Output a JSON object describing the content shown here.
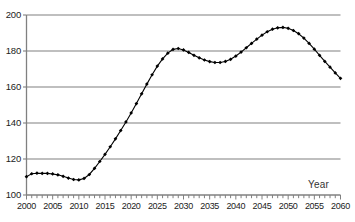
{
  "chart_data": {
    "type": "line",
    "title": "",
    "xlabel": "Year",
    "ylabel": "",
    "xlim": [
      2000,
      2060
    ],
    "ylim": [
      100,
      200
    ],
    "grid": true,
    "legend": null,
    "markers": "filled-diamond",
    "line_color": "#000000",
    "grid_color": "#808080",
    "axis_color": "#808080",
    "x_tick_labels": [
      "2000",
      "2005",
      "2010",
      "2015",
      "2020",
      "2025",
      "2030",
      "2035",
      "2040",
      "2045",
      "2050",
      "2055",
      "2060"
    ],
    "x_tick_step_major": 5,
    "x_tick_step_minor": 1,
    "y_tick_labels": [
      "100",
      "120",
      "140",
      "160",
      "180",
      "200"
    ],
    "y_tick_step": 20,
    "x": [
      2000,
      2001,
      2002,
      2003,
      2004,
      2005,
      2006,
      2007,
      2008,
      2009,
      2010,
      2011,
      2012,
      2013,
      2014,
      2015,
      2016,
      2017,
      2018,
      2019,
      2020,
      2021,
      2022,
      2023,
      2024,
      2025,
      2026,
      2027,
      2028,
      2029,
      2030,
      2031,
      2032,
      2033,
      2034,
      2035,
      2036,
      2037,
      2038,
      2039,
      2040,
      2041,
      2042,
      2043,
      2044,
      2045,
      2046,
      2047,
      2048,
      2049,
      2050,
      2051,
      2052,
      2053,
      2054,
      2055,
      2056,
      2057,
      2058,
      2059,
      2060
    ],
    "values": [
      110.2,
      111.8,
      112.1,
      112.0,
      112.0,
      111.7,
      111.2,
      110.4,
      109.4,
      108.6,
      108.4,
      109.2,
      111.4,
      114.8,
      118.6,
      122.6,
      126.8,
      131.2,
      135.8,
      140.6,
      145.6,
      150.8,
      156.2,
      161.6,
      166.8,
      171.6,
      175.6,
      178.8,
      180.9,
      181.4,
      180.6,
      179.2,
      177.6,
      176.2,
      175.0,
      174.1,
      173.6,
      173.6,
      174.2,
      175.4,
      177.2,
      179.4,
      181.8,
      184.2,
      186.6,
      188.8,
      190.7,
      192.1,
      192.9,
      193.1,
      192.6,
      191.4,
      189.6,
      187.2,
      184.2,
      181.0,
      177.6,
      174.2,
      171.0,
      167.8,
      164.8
    ]
  }
}
